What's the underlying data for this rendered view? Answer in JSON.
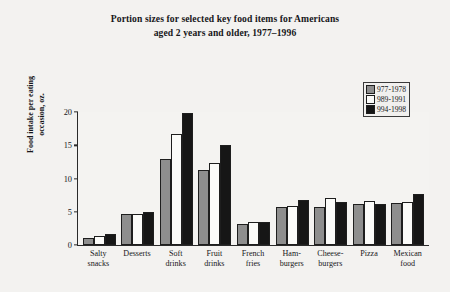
{
  "chart_data": {
    "type": "bar",
    "title": "Portion sizes for selected key food items for Americans aged 2 years and older, 1977–1996",
    "title_line1": "Portion sizes for selected key food items for Americans",
    "title_line2": "aged 2 years and older, 1977–1996",
    "xlabel": "",
    "ylabel": "Food intake per eating occasion, oz.",
    "ylabel_line1": "Food intake per eating",
    "ylabel_line2": "occasion, oz.",
    "ylim": [
      0,
      20
    ],
    "yticks": [
      0,
      5,
      10,
      15,
      20
    ],
    "ytick_labels": [
      "0",
      "5",
      "10",
      "15",
      "20"
    ],
    "grid": false,
    "legend_position": "top-right",
    "categories": [
      "Salty snacks",
      "Desserts",
      "Soft drinks",
      "Fruit drinks",
      "French fries",
      "Hamburgers",
      "Cheeseburgers",
      "Pizza",
      "Mexican food"
    ],
    "category_lines": [
      [
        "Salty",
        "snacks"
      ],
      [
        "Desserts",
        ""
      ],
      [
        "Soft",
        "drinks"
      ],
      [
        "Fruit",
        "drinks"
      ],
      [
        "French",
        "fries"
      ],
      [
        "Ham-",
        "burgers"
      ],
      [
        "Cheese-",
        "burgers"
      ],
      [
        "Pizza",
        ""
      ],
      [
        "Mexican",
        "food"
      ]
    ],
    "series": [
      {
        "name": "977-1978",
        "color": "#8e8e8e",
        "values": [
          1.0,
          4.6,
          13.0,
          11.3,
          3.1,
          5.7,
          5.7,
          6.2,
          6.3
        ]
      },
      {
        "name": "989-1991",
        "color": "#fbfbf9",
        "values": [
          1.3,
          4.7,
          16.7,
          12.3,
          3.4,
          5.8,
          7.0,
          6.6,
          6.5
        ]
      },
      {
        "name": "994-1998",
        "color": "#161616",
        "values": [
          1.6,
          4.9,
          19.9,
          15.1,
          3.4,
          6.8,
          6.5,
          6.1,
          7.6
        ]
      }
    ]
  },
  "legend": {
    "items": [
      {
        "label": "977-1978"
      },
      {
        "label": "989-1991"
      },
      {
        "label": "994-1998"
      }
    ]
  }
}
